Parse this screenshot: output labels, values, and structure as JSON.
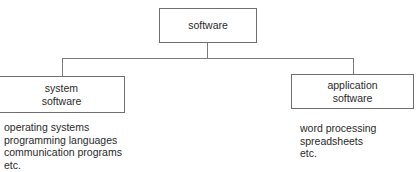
{
  "diagram": {
    "root": {
      "label": "software"
    },
    "children": [
      {
        "id": "system",
        "label_lines": [
          "system",
          "software"
        ],
        "examples": [
          "operating systems",
          "programming languages",
          "communication programs",
          "etc."
        ]
      },
      {
        "id": "application",
        "label_lines": [
          "application",
          "software"
        ],
        "examples": [
          "word processing",
          "spreadsheets",
          "etc."
        ]
      }
    ],
    "colors": {
      "line": "#7a7a7a",
      "border": "#6e6e6e",
      "text": "#2a2a2a",
      "background": "#ffffff"
    }
  }
}
